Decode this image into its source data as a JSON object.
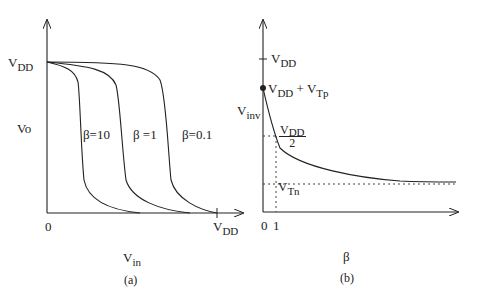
{
  "figure": {
    "panel_a": {
      "caption": "(a)",
      "y_axis_label": "Vo",
      "y_tick_label": {
        "main": "V",
        "sub": "DD"
      },
      "x_axis_label": {
        "main": "V",
        "sub": "in"
      },
      "x_origin_label": "0",
      "x_tick_label": {
        "main": "V",
        "sub": "DD"
      },
      "curves": [
        {
          "label": "β=10"
        },
        {
          "label": "β =1"
        },
        {
          "label": "β=0.1"
        }
      ]
    },
    "panel_b": {
      "caption": "(b)",
      "y_axis_label": {
        "main": "V",
        "sub": "inv"
      },
      "x_axis_label": "β",
      "x_tick_labels": [
        "0",
        "1"
      ],
      "annotations": {
        "vdd": {
          "main": "V",
          "sub": "DD"
        },
        "vdd_plus_vtp": {
          "main1": "V",
          "sub1": "DD",
          "plus": " + ",
          "main2": "V",
          "sub2": "Tp"
        },
        "vdd_half": {
          "num_main": "V",
          "num_sub": "DD",
          "den": "2"
        },
        "vtn": {
          "main": "V",
          "sub": "Tn"
        }
      }
    }
  },
  "colors": {
    "ink": "#222222",
    "background": "#ffffff"
  }
}
